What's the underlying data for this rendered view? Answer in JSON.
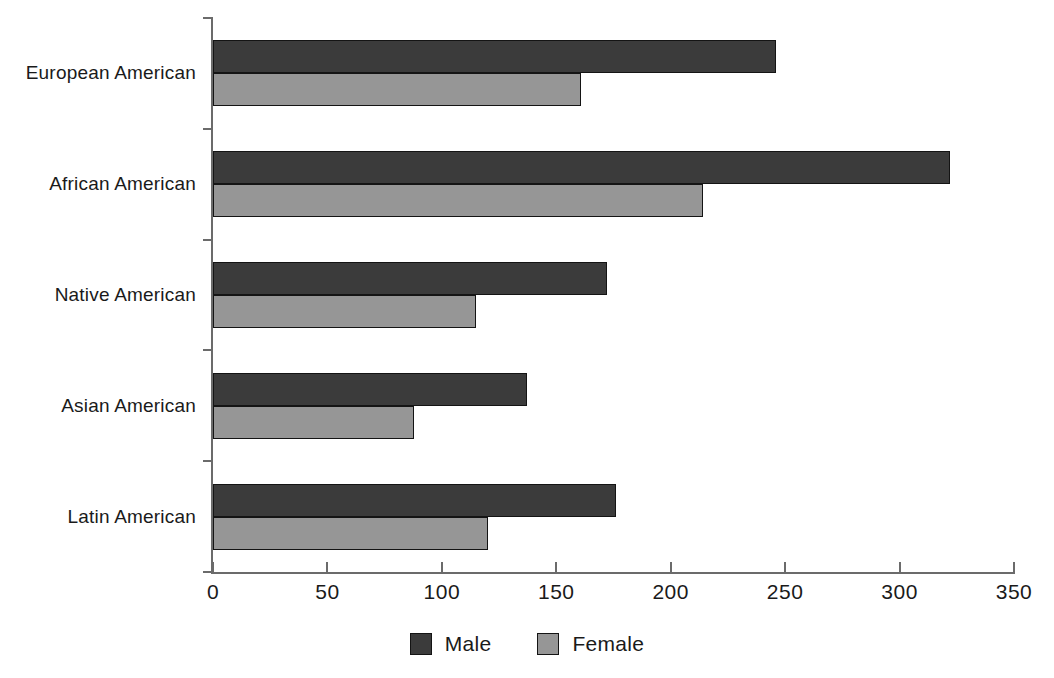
{
  "chart_data": {
    "type": "bar",
    "orientation": "horizontal",
    "title": "",
    "subtitle": "",
    "xlabel": "",
    "ylabel": "",
    "xlim": [
      0,
      350
    ],
    "ylim": null,
    "grid": false,
    "legend_position": "bottom-center",
    "categories": [
      "European American",
      "African American",
      "Native American",
      "Asian American",
      "Latin American"
    ],
    "series": [
      {
        "name": "Male",
        "color": "#3b3b3b",
        "values": [
          246,
          322,
          172,
          137,
          176
        ]
      },
      {
        "name": "Female",
        "color": "#969696",
        "values": [
          161,
          214,
          115,
          88,
          120
        ]
      }
    ],
    "xticks": [
      0,
      50,
      100,
      150,
      200,
      250,
      300,
      350
    ],
    "xtick_labels": [
      "0",
      "50",
      "100",
      "150",
      "200",
      "250",
      "300",
      "350"
    ],
    "annotations": []
  },
  "legend": {
    "items": [
      {
        "label": "Male",
        "swatch": "male-swatch"
      },
      {
        "label": "Female",
        "swatch": "female-swatch"
      }
    ]
  },
  "colors": {
    "male": "#3b3b3b",
    "female": "#969696",
    "axis": "#6b6b6b",
    "bar_outline": "#141414",
    "text": "#1a1a1a",
    "background": "#ffffff"
  }
}
